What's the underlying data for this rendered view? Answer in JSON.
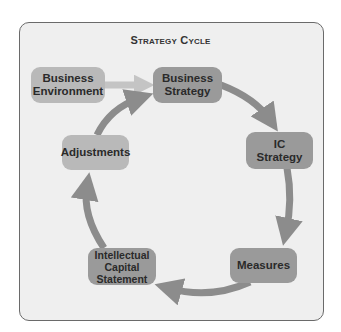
{
  "title": "Strategy Cycle",
  "nodes": [
    {
      "id": "business-environment",
      "label": "Business\nEnvironment"
    },
    {
      "id": "business-strategy",
      "label": "Business\nStrategy"
    },
    {
      "id": "ic-strategy",
      "label": "IC\nStrategy"
    },
    {
      "id": "measures",
      "label": "Measures"
    },
    {
      "id": "intellectual-capital-statement",
      "label": "Intellectual\nCapital\nStatement"
    },
    {
      "id": "adjustments",
      "label": "Adjustments"
    }
  ],
  "edges": [
    {
      "from": "business-environment",
      "to": "business-strategy"
    },
    {
      "from": "business-strategy",
      "to": "ic-strategy"
    },
    {
      "from": "ic-strategy",
      "to": "measures"
    },
    {
      "from": "measures",
      "to": "intellectual-capital-statement"
    },
    {
      "from": "intellectual-capital-statement",
      "to": "adjustments"
    },
    {
      "from": "adjustments",
      "to": "business-strategy"
    }
  ],
  "colors": {
    "panel": "#efefef",
    "arrow": "#8c8c8c",
    "input_arrow": "#c4c4c4",
    "box_light": "#b9b9b9",
    "box_dark": "#9a9a9a"
  }
}
